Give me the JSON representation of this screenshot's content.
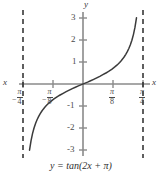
{
  "chart_data": {
    "type": "line",
    "title": "",
    "caption": "y = tan(2x + π)",
    "function": "y = tan(2x + π)",
    "xlabel": "x",
    "ylabel": "y",
    "xlim": [
      -0.8639,
      0.8639
    ],
    "ylim": [
      -3.4,
      3.4
    ],
    "grid": false,
    "legend": null,
    "x_tick_labels": [
      "-π/4",
      "-π/8",
      "π/8",
      "π/4"
    ],
    "x_tick_values": [
      -0.7854,
      -0.3927,
      0.3927,
      0.7854
    ],
    "y_tick_labels": [
      "3",
      "2",
      "1",
      "-1",
      "-2",
      "-3"
    ],
    "y_tick_values": [
      3,
      2,
      1,
      -1,
      -2,
      -3
    ],
    "asymptotes": [
      -0.7854,
      0.7854
    ],
    "asymptote_style": "dashed",
    "series": [
      {
        "name": "tan(2x + π)",
        "x": [
          -0.7,
          -0.68,
          -0.66,
          -0.64,
          -0.62,
          -0.6,
          -0.58,
          -0.56,
          -0.54,
          -0.52,
          -0.5,
          -0.48,
          -0.46,
          -0.44,
          -0.42,
          -0.4,
          -0.38,
          -0.36,
          -0.34,
          -0.32,
          -0.3,
          -0.26,
          -0.22,
          -0.18,
          -0.14,
          -0.1,
          -0.06,
          -0.02,
          0.02,
          0.06,
          0.1,
          0.14,
          0.18,
          0.22,
          0.26,
          0.3,
          0.32,
          0.34,
          0.36,
          0.38,
          0.4,
          0.42,
          0.44,
          0.46,
          0.48,
          0.5,
          0.52,
          0.54,
          0.56,
          0.58,
          0.6,
          0.62,
          0.64,
          0.66,
          0.68,
          0.7
        ],
        "y": [
          -3.0096,
          -2.5722,
          -2.246,
          -1.9912,
          -1.7855,
          -1.6153,
          -1.4715,
          -1.3478,
          -1.2397,
          -1.1441,
          -1.0585,
          -0.9812,
          -0.9109,
          -0.8464,
          -0.7869,
          -0.7316,
          -0.68,
          -0.6314,
          -0.5856,
          -0.5421,
          -0.5006,
          -0.4225,
          -0.3492,
          -0.2795,
          -0.2125,
          -0.1474,
          -0.0837,
          -0.0278,
          0.0278,
          0.0837,
          0.1474,
          0.2125,
          0.2795,
          0.3492,
          0.4225,
          0.5006,
          0.5421,
          0.5856,
          0.6314,
          0.68,
          0.7316,
          0.7869,
          0.8464,
          0.9109,
          0.9812,
          1.0585,
          1.1441,
          1.2397,
          1.3478,
          1.4715,
          1.6153,
          1.7855,
          1.9912,
          2.246,
          2.5722,
          3.0096
        ],
        "color": "#3b3b3b"
      }
    ]
  },
  "axis_labels": {
    "x_left": "x",
    "x_right": "x",
    "y_top": "y"
  },
  "y_ticks": [
    {
      "label": "3"
    },
    {
      "label": "2"
    },
    {
      "label": "1"
    },
    {
      "label": "-1"
    },
    {
      "label": "-2"
    },
    {
      "label": "-3"
    }
  ],
  "x_ticks": [
    {
      "sign": "−",
      "numerator": "π",
      "denominator": "4"
    },
    {
      "sign": "−",
      "numerator": "π",
      "denominator": "8"
    },
    {
      "sign": "",
      "numerator": "π",
      "denominator": "8"
    },
    {
      "sign": "",
      "numerator": "π",
      "denominator": "4"
    }
  ],
  "caption": {
    "text": "y = tan(2x + π)"
  },
  "colors": {
    "curve": "#3b3b3b",
    "axis": "#7d7d7d",
    "asymptote": "#2a2a2a",
    "text": "#3a3a3a",
    "background": "#ffffff"
  }
}
